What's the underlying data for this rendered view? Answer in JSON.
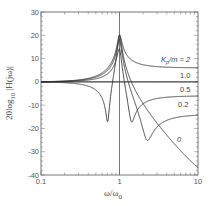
{
  "chart_data": {
    "type": "line",
    "title": "",
    "xlabel": "ω/ω_0",
    "ylabel": "20log10|H(jω)|",
    "xscale": "log",
    "xlim": [
      0.1,
      10
    ],
    "ylim": [
      -40,
      30
    ],
    "x_ticks": [
      {
        "value": 0.1,
        "label": "0.1"
      },
      {
        "value": 1,
        "label": "1"
      },
      {
        "value": 10,
        "label": "10"
      }
    ],
    "y_ticks": [
      {
        "value": 30,
        "label": "30"
      },
      {
        "value": 20,
        "label": "20"
      },
      {
        "value": 10,
        "label": "10"
      },
      {
        "value": 0,
        "label": "0"
      },
      {
        "value": -10,
        "label": "-10"
      },
      {
        "value": -20,
        "label": "-20"
      },
      {
        "value": -30,
        "label": "-30"
      },
      {
        "value": -40,
        "label": "-40"
      }
    ],
    "grid": false,
    "reference_lines": [
      {
        "orientation": "vertical",
        "x": 1
      }
    ],
    "model": {
      "form": "|(1 - K·ω² + j2ζω)/(1 - ω² + j2ζω)|",
      "zeta": 0.05
    },
    "series": [
      {
        "name": "Kp/m = 2",
        "K": 2.0,
        "label": "Kp/m = 2",
        "x": [
          0.1,
          0.3,
          0.5,
          0.707,
          0.9,
          1.0,
          1.5,
          3,
          10
        ],
        "y": [
          -0.1,
          -0.8,
          -3.5,
          -17,
          5.5,
          20,
          3.7,
          5.6,
          6.0
        ]
      },
      {
        "name": "1.0",
        "K": 1.0,
        "label": "1.0",
        "x": [
          0.1,
          0.5,
          0.9,
          1.0,
          1.1,
          3,
          10
        ],
        "y": [
          0,
          0,
          0,
          0,
          0,
          0,
          0
        ]
      },
      {
        "name": "0.5",
        "K": 0.5,
        "label": "0.5",
        "x": [
          0.1,
          0.5,
          0.9,
          1.0,
          1.414,
          2,
          3,
          10
        ],
        "y": [
          0,
          1.1,
          7.9,
          20,
          -16,
          -3.5,
          -5.0,
          -5.9
        ]
      },
      {
        "name": "0.2",
        "K": 0.2,
        "label": "0.2",
        "x": [
          0.1,
          0.5,
          0.9,
          1.0,
          1.5,
          2.236,
          3,
          10
        ],
        "y": [
          0,
          1.6,
          9.5,
          20,
          -3.5,
          -24.5,
          -12.4,
          -13.9
        ]
      },
      {
        "name": "0",
        "K": 0.0,
        "label": "0",
        "x": [
          0.1,
          0.5,
          0.9,
          1.0,
          1.5,
          2,
          3,
          5,
          10
        ],
        "y": [
          0.1,
          2.5,
          13.4,
          20,
          -2.1,
          -9.5,
          -18.1,
          -27.6,
          -39.9
        ]
      }
    ]
  }
}
